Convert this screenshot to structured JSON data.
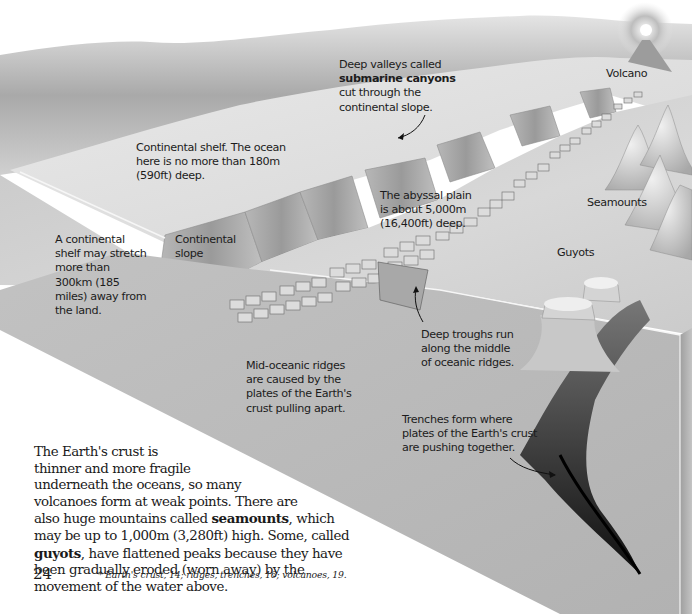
{
  "page": {
    "page_number": "24",
    "footnote": "* Earth's crust, 14; ridges, trenches, 16; volcanoes, 19."
  },
  "labels": {
    "submarine_canyons": {
      "lines": [
        "Deep valleys called",
        "submarine canyons",
        "cut through the",
        "continental slope."
      ],
      "bold_line_index": 1
    },
    "continental_shelf": {
      "lines": [
        "Continental shelf. The ocean",
        "here is no more than 180m",
        "(590ft) deep."
      ]
    },
    "shelf_extent": {
      "lines": [
        "A continental",
        "shelf may stretch",
        "more than",
        "300km (185",
        "miles) away from",
        "the land."
      ]
    },
    "continental_slope": {
      "lines": [
        "Continental",
        "slope"
      ]
    },
    "abyssal_plain": {
      "lines": [
        "The abyssal plain",
        "is about 5,000m",
        "(16,400ft) deep."
      ]
    },
    "volcano": {
      "text": "Volcano"
    },
    "seamounts": {
      "text": "Seamounts"
    },
    "guyots": {
      "text": "Guyots"
    },
    "deep_troughs": {
      "lines": [
        "Deep troughs run",
        "along the middle",
        "of oceanic ridges."
      ]
    },
    "mid_oceanic_ridges": {
      "lines": [
        "Mid-oceanic ridges",
        "are caused by the",
        "plates of the Earth's",
        "crust pulling apart."
      ]
    },
    "trenches": {
      "lines": [
        "Trenches form where",
        "plates of the Earth's crust",
        "are pushing together."
      ]
    }
  },
  "body": {
    "line1": "The Earth's crust is",
    "line2": "thinner and more fragile",
    "line3": "underneath the oceans, so many",
    "line4": "volcanoes form at weak points. There are",
    "line5_pre": "also huge mountains called ",
    "line5_bold": "seamounts",
    "line5_post": ", which",
    "line6": "may be up to 1,000m (3,280ft) high. Some, called",
    "line7_bold": "guyots",
    "line7_post": ", have flattened peaks because they have",
    "line8": "been gradually eroded (worn away) by the",
    "line9": "movement of the water above."
  },
  "colors": {
    "background": "#ffffff",
    "land": "#c9c9c9",
    "shelf": "#dedede",
    "plain": "#d2d2d2",
    "cross_section": "#bdbdbd",
    "trench": "#1e1e1e",
    "text": "#1c1c1c"
  }
}
